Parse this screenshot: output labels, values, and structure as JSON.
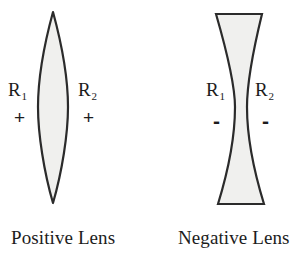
{
  "figure": {
    "background_color": "#ffffff",
    "lens_fill_color": "#f0f0ee",
    "lens_outline_color": "#2b2b2b",
    "text_color": "#1c1c1c"
  },
  "positive_lens": {
    "caption": "Positive Lens",
    "shape": "biconvex",
    "surfaces": [
      {
        "label": "R",
        "subscript": "1",
        "sign": "+"
      },
      {
        "label": "R",
        "subscript": "2",
        "sign": "+"
      }
    ]
  },
  "negative_lens": {
    "caption": "Negative Lens",
    "shape": "biconcave",
    "surfaces": [
      {
        "label": "R",
        "subscript": "1",
        "sign": "-"
      },
      {
        "label": "R",
        "subscript": "2",
        "sign": "-"
      }
    ]
  }
}
